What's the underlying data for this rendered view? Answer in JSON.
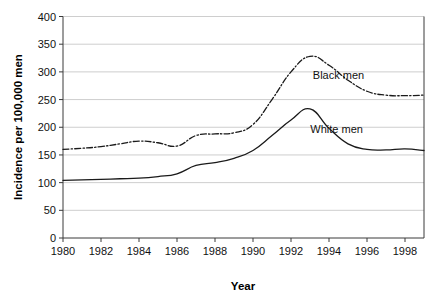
{
  "chart_data": {
    "type": "line",
    "title": "",
    "subtitle": "",
    "xlabel": "Year",
    "ylabel": "Incidence per 100,000 men",
    "xlim": [
      1980,
      1999
    ],
    "ylim": [
      0,
      400
    ],
    "grid": true,
    "grid_axis": "y",
    "legend_position": "inline-right",
    "x": [
      1980,
      1981,
      1982,
      1983,
      1984,
      1985,
      1986,
      1987,
      1988,
      1989,
      1990,
      1991,
      1992,
      1993,
      1994,
      1995,
      1996,
      1997,
      1998,
      1999
    ],
    "xticks": [
      1980,
      1982,
      1984,
      1986,
      1988,
      1990,
      1992,
      1994,
      1996,
      1998
    ],
    "xticklabels": [
      "1980",
      "1982",
      "1984",
      "1986",
      "1988",
      "1990",
      "1992",
      "1994",
      "1996",
      "1998"
    ],
    "yticks": [
      0,
      50,
      100,
      150,
      200,
      250,
      300,
      350,
      400
    ],
    "yticklabels": [
      "0",
      "50",
      "100",
      "150",
      "200",
      "250",
      "300",
      "350",
      "400"
    ],
    "series": [
      {
        "name": "Black men",
        "style": "dash-dot",
        "color": "#1a1a1a",
        "label_text": "Black men",
        "values": [
          160,
          162,
          165,
          170,
          175,
          172,
          166,
          185,
          188,
          190,
          205,
          250,
          300,
          328,
          312,
          285,
          265,
          258,
          257,
          258
        ]
      },
      {
        "name": "White men",
        "style": "solid",
        "color": "#1a1a1a",
        "label_text": "White men",
        "values": [
          104,
          105,
          106,
          107,
          108,
          111,
          116,
          131,
          136,
          144,
          158,
          185,
          213,
          233,
          198,
          170,
          160,
          159,
          161,
          158
        ]
      }
    ],
    "annotations": [
      {
        "text": "Black men",
        "x": 1994.5,
        "y": 287
      },
      {
        "text": "White men",
        "x": 1994.4,
        "y": 190
      }
    ]
  },
  "axis": {
    "y_title": "Incidence per 100,000 men",
    "x_title": "Year"
  },
  "colors": {
    "line": "#1a1a1a",
    "grid": "#b9b9b9",
    "axis": "#3a3a3a",
    "background": "#ffffff",
    "text": "#111111"
  }
}
